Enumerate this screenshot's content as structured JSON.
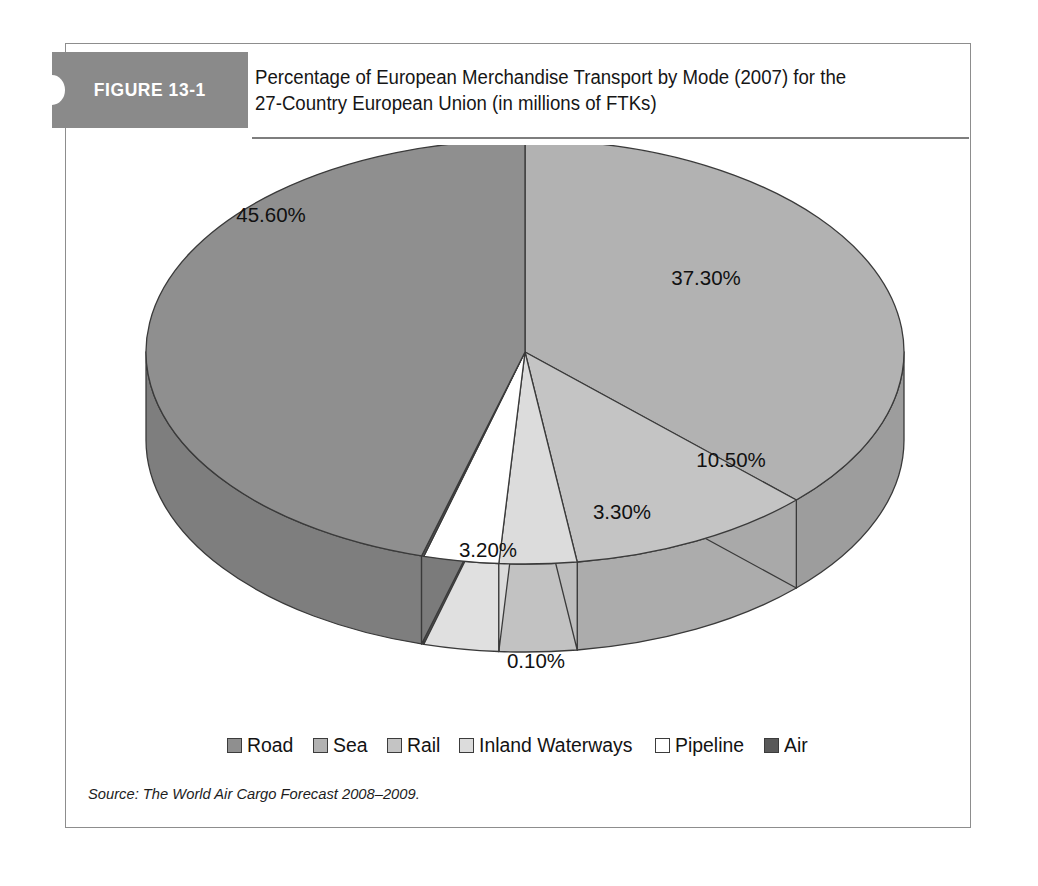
{
  "figure": {
    "label": "FIGURE 13-1",
    "title_line1": "Percentage of European Merchandise Transport by Mode (2007) for the",
    "title_line2": "27-Country European Union (in millions of FTKs)",
    "source": "Source: The World Air Cargo Forecast 2008–2009."
  },
  "legend": {
    "items": [
      {
        "label": "Road",
        "color": "#8f8f8f"
      },
      {
        "label": "Sea",
        "color": "#b2b2b2"
      },
      {
        "label": "Rail",
        "color": "#c4c4c4"
      },
      {
        "label": "Inland Waterways",
        "color": "#dcdcdc"
      },
      {
        "label": "Pipeline",
        "color": "#ffffff"
      },
      {
        "label": "Air",
        "color": "#595959"
      }
    ]
  },
  "labels": {
    "road": "45.60%",
    "sea": "37.30%",
    "rail": "10.50%",
    "inland_waterways": "3.30%",
    "pipeline": "3.20%",
    "air": "0.10%"
  },
  "chart_data": {
    "type": "pie",
    "title": "Percentage of European Merchandise Transport by Mode (2007) for the 27-Country European Union (in millions of FTKs)",
    "unit": "percent",
    "three_d": true,
    "start_angle_deg": 0,
    "direction": "clockwise",
    "legend_position": "bottom",
    "categories": [
      "Road",
      "Sea",
      "Rail",
      "Inland Waterways",
      "Pipeline",
      "Air"
    ],
    "values": [
      45.6,
      37.3,
      10.5,
      3.3,
      3.2,
      0.1
    ],
    "data_labels": [
      "45.60%",
      "37.30%",
      "10.50%",
      "3.30%",
      "3.20%",
      "0.10%"
    ],
    "colors": [
      "#8f8f8f",
      "#b2b2b2",
      "#c4c4c4",
      "#dcdcdc",
      "#ffffff",
      "#595959"
    ],
    "slice_order_clockwise_from_top": [
      "Sea",
      "Rail",
      "Inland Waterways",
      "Pipeline",
      "Air",
      "Road"
    ],
    "source": "The World Air Cargo Forecast 2008–2009."
  }
}
